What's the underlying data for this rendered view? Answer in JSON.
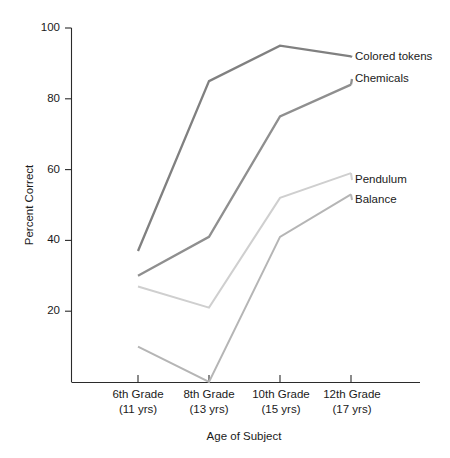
{
  "chart_data": {
    "type": "line",
    "title": "",
    "xlabel": "Age of Subject",
    "ylabel": "Percent Correct",
    "categories": [
      "6th Grade\n(11 yrs)",
      "8th Grade\n(13 yrs)",
      "10th Grade\n(15 yrs)",
      "12th Grade\n(17 yrs)"
    ],
    "x": [
      1,
      2,
      3,
      4
    ],
    "xlim": [
      0.5,
      4.6
    ],
    "ylim": [
      0,
      100
    ],
    "ytick_values": [
      20,
      40,
      60,
      80,
      100
    ],
    "ytick_labels": [
      "20",
      "40",
      "60",
      "80",
      "100"
    ],
    "grid": false,
    "legend_position": "right-inline-labels",
    "series": [
      {
        "name": "Colored tokens",
        "values": [
          37,
          85,
          95,
          92
        ],
        "color": "#808080"
      },
      {
        "name": "Chemicals",
        "values": [
          30,
          41,
          75,
          84
        ],
        "color": "#8f8f8f"
      },
      {
        "name": "Pendulum",
        "values": [
          27,
          21,
          52,
          59
        ],
        "color": "#cfcfcf"
      },
      {
        "name": "Balance",
        "values": [
          10,
          0,
          41,
          53
        ],
        "color": "#b5b5b5"
      }
    ]
  },
  "axes": {
    "y_title": "Percent Correct",
    "x_title": "Age of Subject",
    "y_ticks": [
      {
        "value": 100,
        "label": "100"
      },
      {
        "value": 80,
        "label": "80"
      },
      {
        "value": 60,
        "label": "60"
      },
      {
        "value": 40,
        "label": "40"
      },
      {
        "value": 20,
        "label": "20"
      }
    ],
    "x_ticks": [
      {
        "grade": "6th Grade",
        "age": "(11 yrs)"
      },
      {
        "grade": "8th Grade",
        "age": "(13 yrs)"
      },
      {
        "grade": "10th Grade",
        "age": "(15 yrs)"
      },
      {
        "grade": "12th Grade",
        "age": "(17 yrs)"
      }
    ]
  },
  "series_labels": [
    {
      "text": "Colored tokens"
    },
    {
      "text": "Chemicals"
    },
    {
      "text": "Pendulum"
    },
    {
      "text": "Balance"
    }
  ],
  "colors": {
    "axis": "#2b2b2b",
    "text": "#1a1a1a",
    "background": "#ffffff",
    "colored_tokens": "#808080",
    "chemicals": "#8f8f8f",
    "pendulum": "#cfcfcf",
    "balance": "#b5b5b5"
  }
}
